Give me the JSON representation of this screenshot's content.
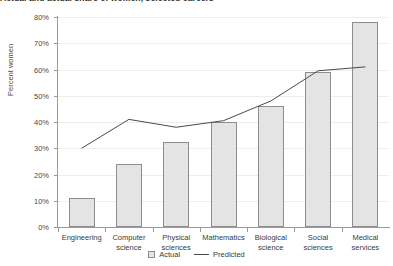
{
  "chart_data": {
    "type": "bar",
    "title": "Actual and actual share of women, selected careers",
    "xlabel": "",
    "ylabel": "Percent women",
    "ylim": [
      0,
      80
    ],
    "ytick_labels": [
      "0%",
      "10%",
      "20%",
      "30%",
      "40%",
      "50%",
      "60%",
      "70%",
      "80%"
    ],
    "ytick_values": [
      0,
      10,
      20,
      30,
      40,
      50,
      60,
      70,
      80
    ],
    "grid": true,
    "legend_position": "bottom",
    "categories": [
      "Engineering",
      "Computer science",
      "Physical sciences",
      "Mathematics",
      "Biological science",
      "Social sciences",
      "Medical services"
    ],
    "series": [
      {
        "name": "Actual",
        "type": "bar",
        "values": [
          11,
          24,
          32.5,
          40,
          46,
          59,
          78
        ]
      },
      {
        "name": "Predicted",
        "type": "line",
        "values": [
          30,
          41,
          38,
          40.5,
          48,
          59.5,
          61
        ]
      }
    ]
  },
  "legend": {
    "actual_label": "Actual",
    "predicted_label": "Predicted"
  },
  "colors": {
    "bar_fill": "#e4e4e4",
    "bar_stroke": "#8d8d8d",
    "line": "#4a4a4a",
    "axis": "#9a9a9a",
    "grid": "#ededed",
    "text": "#3a3a3a"
  }
}
